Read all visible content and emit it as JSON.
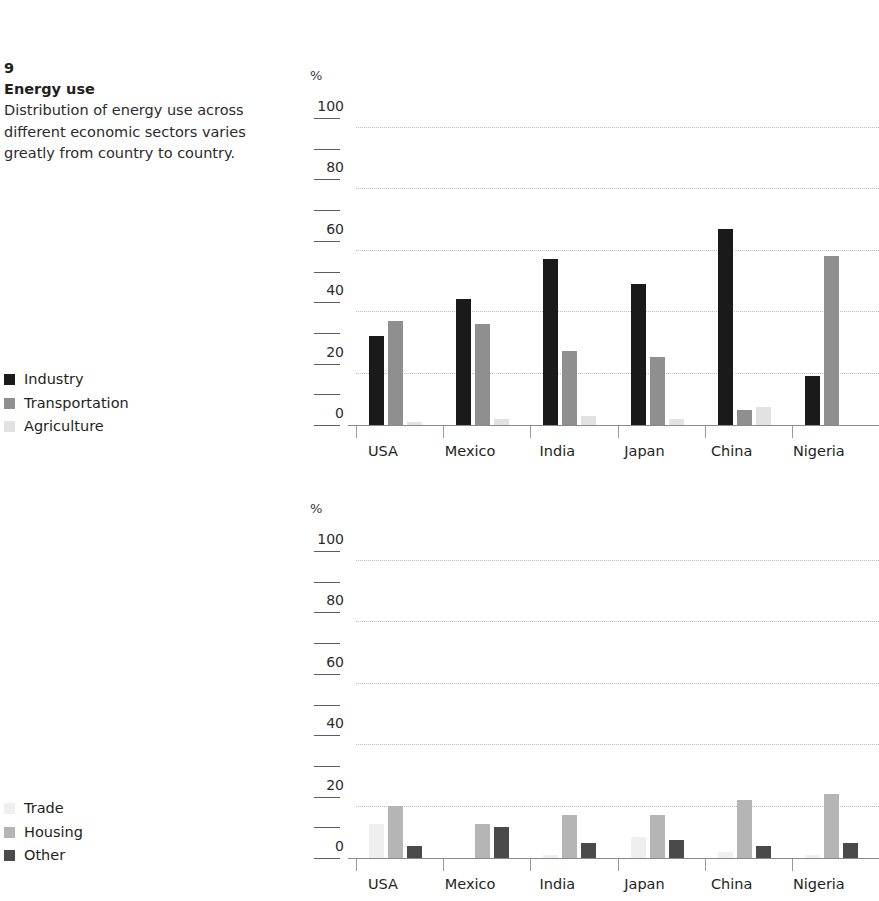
{
  "caption": {
    "number": "9",
    "title": "Energy use",
    "body": "Distribution of energy use across different economic sectors varies greatly from country to country."
  },
  "legends": {
    "top": {
      "items": [
        {
          "label": "Industry",
          "color": "#1a1a1a"
        },
        {
          "label": "Transportation",
          "color": "#8f8f8f"
        },
        {
          "label": "Agriculture",
          "color": "#e2e2e2"
        }
      ]
    },
    "bottom": {
      "items": [
        {
          "label": "Trade",
          "color": "#efefef"
        },
        {
          "label": "Housing",
          "color": "#b5b5b5"
        },
        {
          "label": "Other",
          "color": "#4a4a4a"
        }
      ]
    }
  },
  "chart_data": [
    {
      "type": "bar",
      "id": "top",
      "title": "Energy use",
      "xlabel": "",
      "ylabel": "%",
      "ylim": [
        0,
        100
      ],
      "yticks": [
        0,
        20,
        40,
        60,
        80,
        100
      ],
      "ytick_labels": [
        "0",
        "20",
        "40",
        "60",
        "80",
        "100"
      ],
      "minor_ticks": [
        10,
        30,
        50,
        70,
        90
      ],
      "grid": true,
      "legend_position": "left",
      "categories": [
        "USA",
        "Mexico",
        "India",
        "Japan",
        "China",
        "Nigeria"
      ],
      "series": [
        {
          "name": "Industry",
          "color": "#1a1a1a",
          "values": [
            29,
            41,
            54,
            46,
            64,
            16
          ]
        },
        {
          "name": "Transportation",
          "color": "#8f8f8f",
          "values": [
            34,
            33,
            24,
            22,
            5,
            55
          ]
        },
        {
          "name": "Agriculture",
          "color": "#e2e2e2",
          "values": [
            1,
            2,
            3,
            2,
            6,
            0
          ]
        }
      ]
    },
    {
      "type": "bar",
      "id": "bottom",
      "title": "",
      "xlabel": "",
      "ylabel": "%",
      "ylim": [
        0,
        100
      ],
      "yticks": [
        0,
        20,
        40,
        60,
        80,
        100
      ],
      "ytick_labels": [
        "0",
        "20",
        "40",
        "60",
        "80",
        "100"
      ],
      "minor_ticks": [
        10,
        30,
        50,
        70,
        90
      ],
      "grid": true,
      "legend_position": "left",
      "categories": [
        "USA",
        "Mexico",
        "India",
        "Japan",
        "China",
        "Nigeria"
      ],
      "series": [
        {
          "name": "Trade",
          "color": "#efefef",
          "values": [
            11,
            0,
            1,
            7,
            2,
            1
          ]
        },
        {
          "name": "Housing",
          "color": "#b5b5b5",
          "values": [
            17,
            11,
            14,
            14,
            19,
            21
          ]
        },
        {
          "name": "Other",
          "color": "#4a4a4a",
          "values": [
            4,
            10,
            5,
            6,
            4,
            5
          ]
        }
      ]
    }
  ]
}
